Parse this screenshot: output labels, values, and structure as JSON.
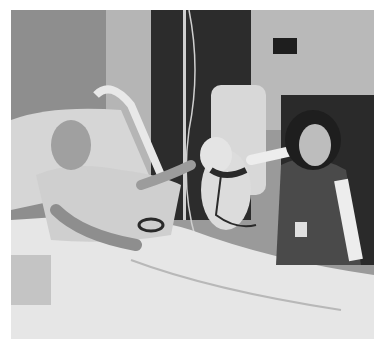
{
  "image": {
    "description": "Black-and-white photo of a smiling older man in a hospital bed petting a therapy dog, with a smiling woman wearing an ID badge kneeling beside the bed",
    "style": "grayscale",
    "subjects": [
      "patient-in-bed",
      "therapy-dog",
      "volunteer-woman"
    ],
    "colors": {
      "wall": "#a8a8a8",
      "dark_wall": "#3a3a3a",
      "sheets": "#e6e6e6",
      "shadow": "#1e1e1e",
      "border": "#ffffff"
    }
  }
}
